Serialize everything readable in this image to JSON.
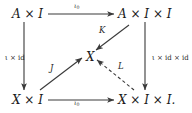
{
  "diagram": {
    "type": "commutative-diagram",
    "stroke_color": "#3a3a3a",
    "text_color": "#1a1a1a",
    "background": "#ffffff",
    "nodes": {
      "top_left": "A × I",
      "top_right": "A × I × I",
      "center": "X",
      "bottom_left": "X × I",
      "bottom_right": "X × I × I."
    },
    "arrows": {
      "top": {
        "label": "ι",
        "subscript": "0",
        "from": "A × I",
        "to": "A × I × I",
        "style": "solid",
        "direction": "right"
      },
      "bottom": {
        "label": "ι",
        "subscript": "0",
        "from": "X × I",
        "to": "X × I × I.",
        "style": "solid",
        "direction": "right"
      },
      "left": {
        "label": "ι × id",
        "from": "A × I",
        "to": "X × I",
        "style": "solid",
        "direction": "down"
      },
      "right": {
        "label": "ι × id × id",
        "from": "A × I × I",
        "to": "X × I × I.",
        "style": "solid",
        "direction": "down"
      },
      "diagonal_k": {
        "label": "K",
        "from": "A × I × I",
        "to": "X",
        "style": "solid",
        "direction": "down-left"
      },
      "diagonal_j": {
        "label": "J",
        "from": "X × I",
        "to": "X",
        "style": "solid",
        "direction": "up-right"
      },
      "diagonal_l": {
        "label": "L",
        "from": "X × I × I.",
        "to": "X",
        "style": "dashed",
        "direction": "up-left"
      }
    }
  }
}
